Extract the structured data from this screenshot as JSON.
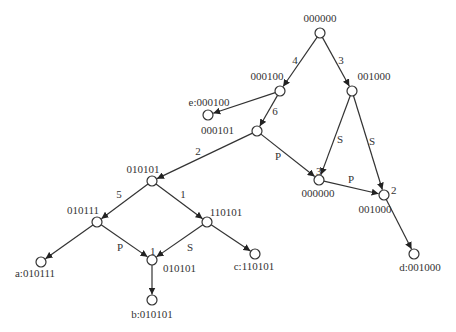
{
  "diagram": {
    "type": "directed-graph",
    "colors": {
      "stroke": "#333333",
      "node_fill": "#ffffff",
      "text": "#333333"
    },
    "nodes": [
      {
        "id": "n0",
        "label": "000000",
        "x": 320,
        "y": 33,
        "lx": 320,
        "ly": 22,
        "anchor": "middle"
      },
      {
        "id": "n1",
        "label": "000100",
        "x": 280,
        "y": 91,
        "lx": 267,
        "ly": 80,
        "anchor": "middle"
      },
      {
        "id": "n2",
        "label": "001000",
        "x": 352,
        "y": 91,
        "lx": 374,
        "ly": 80,
        "anchor": "middle"
      },
      {
        "id": "n3",
        "label": "e:000100",
        "x": 208,
        "y": 115,
        "lx": 209,
        "ly": 106,
        "anchor": "middle"
      },
      {
        "id": "n4",
        "label": "000101",
        "x": 257,
        "y": 131,
        "lx": 234,
        "ly": 134,
        "anchor": "end"
      },
      {
        "id": "n5",
        "label": "010101",
        "x": 152,
        "y": 181,
        "lx": 143,
        "ly": 173,
        "anchor": "middle"
      },
      {
        "id": "n6",
        "label": "000000",
        "x": 319,
        "y": 180,
        "lx": 318,
        "ly": 197,
        "anchor": "middle"
      },
      {
        "id": "n7",
        "label": "001000",
        "x": 384,
        "y": 195,
        "lx": 375,
        "ly": 213,
        "anchor": "middle"
      },
      {
        "id": "n8",
        "label": "010111",
        "x": 97,
        "y": 222,
        "lx": 83,
        "ly": 214,
        "anchor": "middle"
      },
      {
        "id": "n9",
        "label": "110101",
        "x": 207,
        "y": 222,
        "lx": 226,
        "ly": 216,
        "anchor": "middle"
      },
      {
        "id": "n10",
        "label": "010101",
        "x": 152,
        "y": 260,
        "lx": 163,
        "ly": 272,
        "anchor": "start"
      },
      {
        "id": "n11",
        "label": "a:010111",
        "x": 41,
        "y": 262,
        "lx": 35,
        "ly": 277,
        "anchor": "middle"
      },
      {
        "id": "n12",
        "label": "c:110101",
        "x": 255,
        "y": 254,
        "lx": 254,
        "ly": 270,
        "anchor": "middle"
      },
      {
        "id": "n13",
        "label": "d:001000",
        "x": 414,
        "y": 254,
        "lx": 420,
        "ly": 271,
        "anchor": "middle"
      },
      {
        "id": "n14",
        "label": "b:010101",
        "x": 152,
        "y": 300,
        "lx": 152,
        "ly": 318,
        "anchor": "middle"
      }
    ],
    "edges": [
      {
        "from": "n0",
        "to": "n1",
        "label": "4",
        "lx": 295,
        "ly": 64
      },
      {
        "from": "n0",
        "to": "n2",
        "label": "3",
        "lx": 341,
        "ly": 64
      },
      {
        "from": "n1",
        "to": "n3",
        "label": "",
        "lx": 0,
        "ly": 0
      },
      {
        "from": "n1",
        "to": "n4",
        "label": "6",
        "lx": 275,
        "ly": 115
      },
      {
        "from": "n4",
        "to": "n5",
        "label": "2",
        "lx": 198,
        "ly": 155
      },
      {
        "from": "n4",
        "to": "n6",
        "label": "P",
        "lx": 278,
        "ly": 160
      },
      {
        "from": "n2",
        "to": "n6",
        "label": "S",
        "lx": 340,
        "ly": 143
      },
      {
        "from": "n2",
        "to": "n7",
        "label": "S",
        "lx": 372,
        "ly": 145
      },
      {
        "from": "n6",
        "to": "n7",
        "label": "P",
        "lx": 351,
        "ly": 183
      },
      {
        "from": "n7",
        "to": "n13",
        "label": "",
        "lx": 0,
        "ly": 0
      },
      {
        "from": "n5",
        "to": "n8",
        "label": "5",
        "lx": 119,
        "ly": 198
      },
      {
        "from": "n5",
        "to": "n9",
        "label": "1",
        "lx": 183,
        "ly": 198
      },
      {
        "from": "n8",
        "to": "n11",
        "label": "",
        "lx": 0,
        "ly": 0
      },
      {
        "from": "n8",
        "to": "n10",
        "label": "P",
        "lx": 120,
        "ly": 251
      },
      {
        "from": "n9",
        "to": "n10",
        "label": "S",
        "lx": 190,
        "ly": 251
      },
      {
        "from": "n9",
        "to": "n12",
        "label": "",
        "lx": 0,
        "ly": 0
      },
      {
        "from": "n10",
        "to": "n14",
        "label": "",
        "lx": 0,
        "ly": 0
      }
    ],
    "node_annotations": [
      {
        "node": "n6",
        "text": "3",
        "x": 316,
        "y": 175
      },
      {
        "node": "n7",
        "text": "2",
        "x": 391,
        "y": 194
      },
      {
        "node": "n10",
        "text": "1",
        "x": 150,
        "y": 255
      }
    ]
  }
}
